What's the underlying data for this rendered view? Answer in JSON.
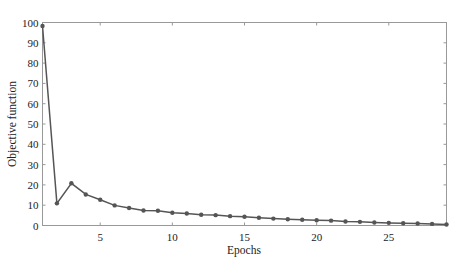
{
  "chart_data": {
    "type": "line",
    "title": "",
    "xlabel": "Epochs",
    "ylabel": "Objective function",
    "xlim": [
      1,
      29
    ],
    "ylim": [
      0,
      100
    ],
    "xticks": [
      5,
      10,
      15,
      20,
      25
    ],
    "yticks": [
      0,
      10,
      20,
      30,
      40,
      50,
      60,
      70,
      80,
      90,
      100
    ],
    "grid": false,
    "legend": null,
    "series": [
      {
        "name": "Objective function",
        "color": "#555555",
        "marker": "circle",
        "x": [
          1,
          2,
          3,
          4,
          5,
          6,
          7,
          8,
          9,
          10,
          11,
          12,
          13,
          14,
          15,
          16,
          17,
          18,
          19,
          20,
          21,
          22,
          23,
          24,
          25,
          26,
          27,
          28,
          29
        ],
        "values": [
          98.3,
          10.9,
          20.8,
          15.3,
          12.7,
          9.9,
          8.6,
          7.4,
          7.3,
          6.3,
          5.9,
          5.3,
          5.1,
          4.6,
          4.3,
          3.8,
          3.4,
          3.1,
          2.8,
          2.6,
          2.4,
          2.0,
          1.8,
          1.5,
          1.3,
          1.1,
          1.0,
          0.8,
          0.5
        ]
      }
    ]
  }
}
